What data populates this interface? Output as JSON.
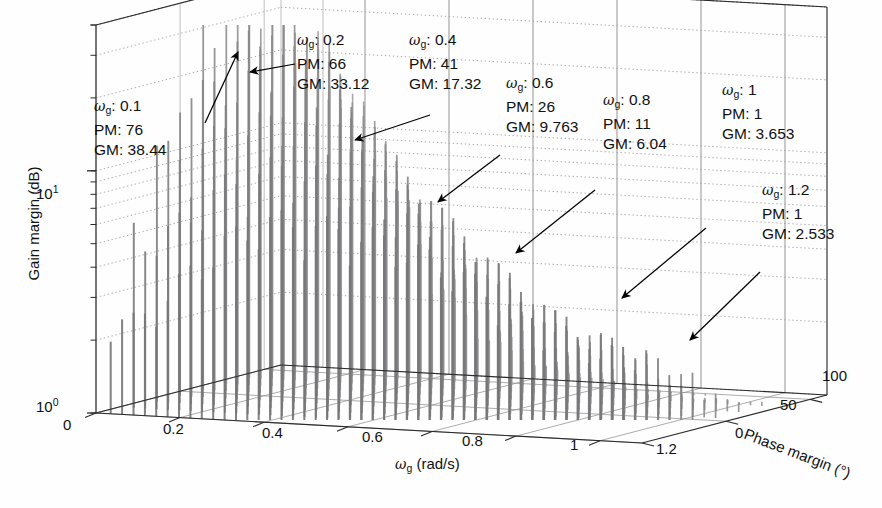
{
  "figure": {
    "kind": "3d-stem-plot",
    "background": "#ffffff",
    "bar_color": "#8c8c8c",
    "axis_color": "#2b2b2b",
    "grid_color": "#9a9a9a",
    "arrow_color": "#000000"
  },
  "axes": {
    "y": {
      "label": "Gain margin (dB)",
      "scale": "log",
      "ticks": [
        "10",
        "10"
      ],
      "tick_exponents": [
        "1",
        "0"
      ],
      "tick_labels_full": [
        "10^1",
        "10^0"
      ],
      "range": [
        1,
        40
      ]
    },
    "x": {
      "label": "ω",
      "label_sub": "g",
      "label_units": "(rad/s)",
      "label_full": "ω_g (rad/s)",
      "ticks": [
        "0",
        "0.2",
        "0.4",
        "0.6",
        "0.8",
        "1",
        "1.2"
      ],
      "range": [
        0,
        1.3
      ]
    },
    "z": {
      "label": "Phase margin (°)",
      "ticks": [
        "0",
        "50",
        "100"
      ],
      "range": [
        0,
        110
      ]
    }
  },
  "annotations": [
    {
      "id": "a1",
      "omega_label": "ω",
      "omega_sub": "g",
      "omega_value": ": 0.1",
      "pm": "PM: 76",
      "gm": "GM: 38.44",
      "omega": 0.1,
      "phase_margin": 76,
      "gain_margin": 38.44
    },
    {
      "id": "a2",
      "omega_label": "ω",
      "omega_sub": "g",
      "omega_value": ": 0.2",
      "pm": "PM: 66",
      "gm": "GM: 33.12",
      "omega": 0.2,
      "phase_margin": 66,
      "gain_margin": 33.12
    },
    {
      "id": "a3",
      "omega_label": "ω",
      "omega_sub": "g",
      "omega_value": ": 0.4",
      "pm": "PM: 41",
      "gm": "GM: 17.32",
      "omega": 0.4,
      "phase_margin": 41,
      "gain_margin": 17.32
    },
    {
      "id": "a4",
      "omega_label": "ω",
      "omega_sub": "g",
      "omega_value": ": 0.6",
      "pm": "PM: 26",
      "gm": "GM: 9.763",
      "omega": 0.6,
      "phase_margin": 26,
      "gain_margin": 9.763
    },
    {
      "id": "a5",
      "omega_label": "ω",
      "omega_sub": "g",
      "omega_value": ": 0.8",
      "pm": "PM: 11",
      "gm": "GM: 6.04",
      "omega": 0.8,
      "phase_margin": 11,
      "gain_margin": 6.04
    },
    {
      "id": "a6",
      "omega_label": "ω",
      "omega_sub": "g",
      "omega_value": ": 1",
      "pm": "PM: 1",
      "gm": "GM: 3.653",
      "omega": 1,
      "phase_margin": 1,
      "gain_margin": 3.653
    },
    {
      "id": "a7",
      "omega_label": "ω",
      "omega_sub": "g",
      "omega_value": ": 1.2",
      "pm": "PM: 1",
      "gm": "GM: 2.533",
      "omega": 1.2,
      "phase_margin": 1,
      "gain_margin": 2.533
    }
  ],
  "chart_data": {
    "type": "bar",
    "title": "",
    "xlabel": "ω_g (rad/s)",
    "ylabel": "Gain margin (dB)",
    "zlabel": "Phase margin (°)",
    "yscale": "log",
    "ylim": [
      1,
      40
    ],
    "xlim": [
      0,
      1.3
    ],
    "zlim": [
      0,
      110
    ],
    "grid": true,
    "legend": null,
    "marked_points": [
      {
        "omega_g": 0.1,
        "phase_margin": 76,
        "gain_margin": 38.44
      },
      {
        "omega_g": 0.2,
        "phase_margin": 66,
        "gain_margin": 33.12
      },
      {
        "omega_g": 0.4,
        "phase_margin": 41,
        "gain_margin": 17.32
      },
      {
        "omega_g": 0.6,
        "phase_margin": 26,
        "gain_margin": 9.763
      },
      {
        "omega_g": 0.8,
        "phase_margin": 11,
        "gain_margin": 6.04
      },
      {
        "omega_g": 1.0,
        "phase_margin": 1,
        "gain_margin": 3.653
      },
      {
        "omega_g": 1.2,
        "phase_margin": 1,
        "gain_margin": 2.533
      }
    ],
    "envelope_gain_margin": [
      38.44,
      33.12,
      17.32,
      9.763,
      6.04,
      3.653,
      2.533
    ],
    "envelope_omega_g": [
      0.1,
      0.2,
      0.4,
      0.6,
      0.8,
      1.0,
      1.2
    ],
    "envelope_phase_margin": [
      76,
      66,
      41,
      26,
      11,
      1,
      1
    ]
  }
}
